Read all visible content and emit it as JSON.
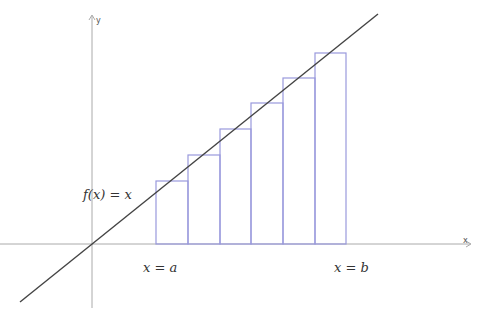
{
  "diagram": {
    "axes": {
      "x_label": "x",
      "y_label": "y"
    },
    "function_label": "f(x) = x",
    "bound_a_label": "x = a",
    "bound_b_label": "x = b",
    "colors": {
      "axes": "#999999",
      "function": "#444444",
      "rectangles": "#9999dd"
    },
    "rectangles": [
      {
        "x0": 156,
        "x1": 188,
        "top": 181
      },
      {
        "x0": 188,
        "x1": 220,
        "top": 155
      },
      {
        "x0": 220,
        "x1": 251,
        "top": 129
      },
      {
        "x0": 251,
        "x1": 283,
        "top": 103
      },
      {
        "x0": 283,
        "x1": 315,
        "top": 78
      },
      {
        "x0": 315,
        "x1": 346,
        "top": 53
      }
    ]
  }
}
